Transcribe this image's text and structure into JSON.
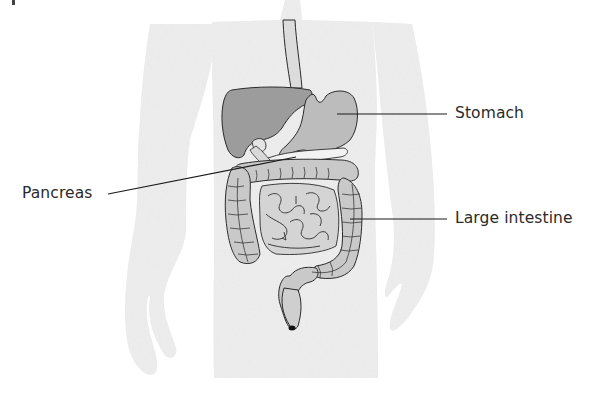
{
  "figure": {
    "colors": {
      "background": "#ffffff",
      "body_silhouette": "#e6e6e6",
      "liver": "#9a9a9a",
      "stomach": "#b9b9b9",
      "intestine": "#c8c8c8",
      "outline": "#2b2b2b",
      "leader_line": "#1a1a1a",
      "label_text": "#2a2a2a"
    }
  },
  "labels": {
    "stomach": "Stomach",
    "pancreas": "Pancreas",
    "large_intestine": "Large intestine"
  },
  "leader_lines": {
    "stomach": {
      "from": [
        337,
        114
      ],
      "to": [
        447,
        114
      ]
    },
    "pancreas": {
      "from": [
        108,
        194
      ],
      "to": [
        296,
        157
      ]
    },
    "large_intestine": {
      "from": [
        350,
        219
      ],
      "to": [
        447,
        219
      ]
    }
  }
}
